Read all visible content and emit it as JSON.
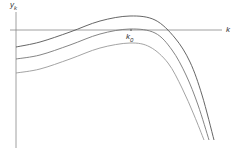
{
  "chart_data": {
    "type": "line",
    "title": "",
    "xlabel": "k",
    "ylabel": "y",
    "ylabel_subscript": "k",
    "annotations": [
      {
        "text": "k",
        "subscript": "0",
        "x": 131,
        "note": "marks peak of middle curve on k-axis"
      }
    ],
    "grid": false,
    "legend": null,
    "series": [
      {
        "name": "upper",
        "points": [
          [
            16,
            47
          ],
          [
            40,
            42
          ],
          [
            70,
            32
          ],
          [
            100,
            21
          ],
          [
            130,
            16
          ],
          [
            155,
            20
          ],
          [
            175,
            38
          ],
          [
            190,
            62
          ],
          [
            202,
            95
          ],
          [
            214,
            140
          ]
        ]
      },
      {
        "name": "middle",
        "points": [
          [
            16,
            59
          ],
          [
            40,
            55
          ],
          [
            70,
            45
          ],
          [
            100,
            34
          ],
          [
            130,
            29
          ],
          [
            155,
            33
          ],
          [
            172,
            50
          ],
          [
            186,
            75
          ],
          [
            198,
            105
          ],
          [
            209,
            140
          ]
        ]
      },
      {
        "name": "lower",
        "points": [
          [
            16,
            73
          ],
          [
            40,
            69
          ],
          [
            70,
            59
          ],
          [
            100,
            48
          ],
          [
            130,
            43
          ],
          [
            150,
            47
          ],
          [
            168,
            63
          ],
          [
            182,
            88
          ],
          [
            194,
            115
          ],
          [
            204,
            140
          ]
        ]
      }
    ],
    "axes": {
      "y_axis": {
        "x": 16,
        "y_top": 12,
        "y_bottom": 148
      },
      "x_axis": {
        "y": 30,
        "x_left": 10,
        "x_right": 222
      }
    },
    "colors": {
      "upper": "#555555",
      "middle": "#777777",
      "lower": "#999999",
      "axis": "#888888"
    }
  },
  "labels": {
    "y_main": "y",
    "y_sub": "k",
    "x": "k",
    "k0_main": "k",
    "k0_sub": "0"
  }
}
